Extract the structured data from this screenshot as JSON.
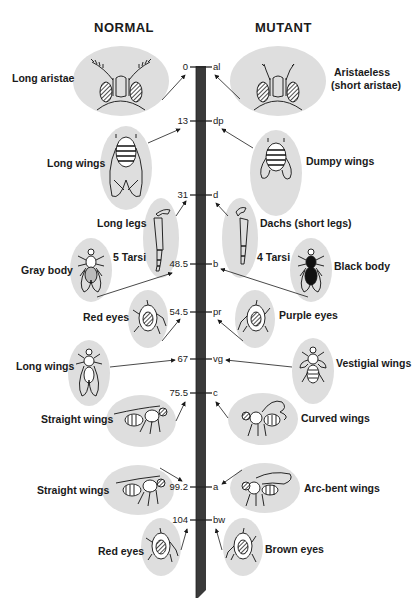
{
  "headings": {
    "normal": "NORMAL",
    "mutant": "MUTANT"
  },
  "loci": [
    {
      "pos": "0",
      "symbol": "al",
      "y": 67
    },
    {
      "pos": "13",
      "symbol": "dp",
      "y": 121
    },
    {
      "pos": "31",
      "symbol": "d",
      "y": 195
    },
    {
      "pos": "48.5",
      "symbol": "b",
      "y": 264
    },
    {
      "pos": "54.5",
      "symbol": "pr",
      "y": 312
    },
    {
      "pos": "67",
      "symbol": "vg",
      "y": 359
    },
    {
      "pos": "75.5",
      "symbol": "c",
      "y": 393
    },
    {
      "pos": "99.2",
      "symbol": "a",
      "y": 487
    },
    {
      "pos": "104",
      "symbol": "bw",
      "y": 520
    }
  ],
  "normal_traits": [
    {
      "label": "Long aristae",
      "icon": "fly-head-long-aristae"
    },
    {
      "label": "Long wings",
      "icon": "fly-long-wings"
    },
    {
      "label": "Long legs",
      "icon": "fly-leg-long"
    },
    {
      "label": "5 Tarsi",
      "icon": ""
    },
    {
      "label": "Gray body",
      "icon": "fly-gray-body"
    },
    {
      "label": "Red eyes",
      "icon": "fly-eye-red"
    },
    {
      "label": "Long wings",
      "icon": "fly-long-wings-top"
    },
    {
      "label": "Straight wings",
      "icon": "fly-straight-wings-side"
    },
    {
      "label": "Straight wings",
      "icon": "fly-straight-wings-side"
    },
    {
      "label": "Red eyes",
      "icon": "fly-eye-red"
    }
  ],
  "mutant_traits": [
    {
      "label": "Aristaeless",
      "label2": "(short aristae)",
      "icon": "fly-head-short-aristae"
    },
    {
      "label": "Dumpy wings",
      "icon": "fly-dumpy-wings"
    },
    {
      "label": "Dachs (short legs)",
      "icon": "fly-leg-short"
    },
    {
      "label": "4 Tarsi",
      "icon": ""
    },
    {
      "label": "Black body",
      "icon": "fly-black-body"
    },
    {
      "label": "Purple eyes",
      "icon": "fly-eye-purple"
    },
    {
      "label": "Vestigial wings",
      "icon": "fly-vestigial-wings"
    },
    {
      "label": "Curved wings",
      "icon": "fly-curved-wings"
    },
    {
      "label": "Arc-bent wings",
      "icon": "fly-arc-bent-wings"
    },
    {
      "label": "Brown eyes",
      "icon": "fly-eye-brown"
    }
  ],
  "colors": {
    "oval": "#dedede",
    "chromosome": "#3a3a3a",
    "ink": "#1a1a1a"
  }
}
